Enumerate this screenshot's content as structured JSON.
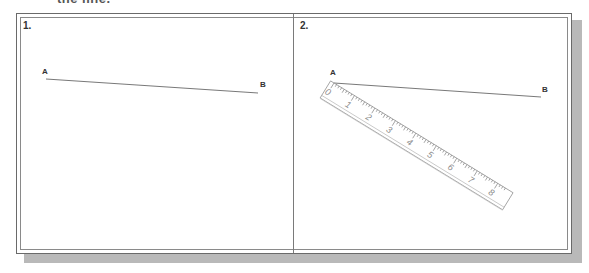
{
  "caption": "the line.",
  "panels": [
    {
      "number": "1.",
      "point_a": "A",
      "point_b": "B"
    },
    {
      "number": "2.",
      "point_a": "A",
      "point_b": "B",
      "ruler": {
        "labels": [
          "0",
          "1",
          "2",
          "3",
          "4",
          "5",
          "6",
          "7",
          "8"
        ]
      }
    }
  ],
  "colors": {
    "line": "#555555",
    "frame": "#6a6a6a",
    "shadow": "#b9b9b9",
    "ruler_outline": "#9a9a9a"
  }
}
